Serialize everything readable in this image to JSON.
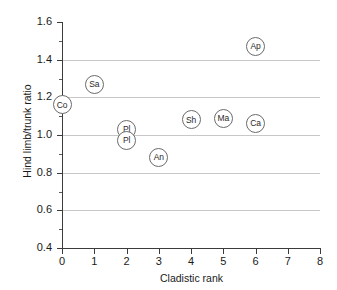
{
  "chart_data": {
    "type": "scatter",
    "title": "",
    "xlabel": "Cladistic rank",
    "ylabel": "Hind limb/trunk ratio",
    "xlim": [
      0,
      8
    ],
    "ylim": [
      0.4,
      1.6
    ],
    "x_ticks": [
      "0",
      "1",
      "2",
      "3",
      "4",
      "5",
      "6",
      "7",
      "8"
    ],
    "y_ticks": [
      "0.4",
      "0.6",
      "0.8",
      "1.0",
      "1.2",
      "1.4",
      "1.6"
    ],
    "y_minor_tick_values": [
      0.5,
      0.7,
      0.9,
      1.1,
      1.3,
      1.5
    ],
    "grid": "horizontal-major-only",
    "gridline_values": [
      0.6,
      0.8,
      1.0,
      1.2,
      1.4
    ],
    "legend": "none",
    "marker_style": "open-circle-with-label",
    "points": [
      {
        "label": "Co",
        "x": 0,
        "y": 1.16
      },
      {
        "label": "Sa",
        "x": 1,
        "y": 1.27
      },
      {
        "label": "Pl",
        "x": 2,
        "y": 1.03
      },
      {
        "label": "Pl",
        "x": 2,
        "y": 0.97
      },
      {
        "label": "An",
        "x": 3,
        "y": 0.88
      },
      {
        "label": "Sh",
        "x": 4,
        "y": 1.08
      },
      {
        "label": "Ma",
        "x": 5,
        "y": 1.09
      },
      {
        "label": "Ca",
        "x": 6,
        "y": 1.06
      },
      {
        "label": "Ap",
        "x": 6,
        "y": 1.47
      }
    ]
  },
  "colors": {
    "axis": "#3b3b3b",
    "gridline": "#c8c8c8",
    "marker_stroke": "#6b6b6b",
    "marker_fill": "#ffffff",
    "text": "#1a1a1a",
    "background": "#ffffff"
  }
}
